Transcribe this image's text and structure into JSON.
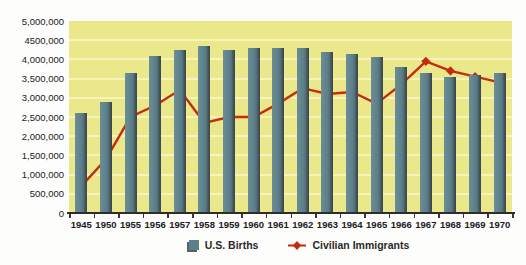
{
  "chart": {
    "y_axis_labels": [
      "5,000,000",
      "4500,000",
      "4,000,000",
      "3,500,000",
      "3,000,000",
      "2,500,000",
      "2,000,000",
      "1,500,000",
      "1,000,000",
      "500,000",
      "0"
    ],
    "background_color": "#ebe88c",
    "gridline_color": "#f7f4ba",
    "axis_color": "#2e2d2b"
  },
  "chart_data": {
    "type": "bar",
    "title": "",
    "xlabel": "",
    "ylabel": "",
    "categories": [
      "1945",
      "1950",
      "1955",
      "1956",
      "1957",
      "1958",
      "1959",
      "1960",
      "1961",
      "1962",
      "1963",
      "1964",
      "1965",
      "1966",
      "1967",
      "1968",
      "1969",
      "1970"
    ],
    "series": [
      {
        "name": "U.S. Births",
        "type": "bar",
        "color": "#5c7f8a",
        "values": [
          2600000,
          2900000,
          3650000,
          4100000,
          4250000,
          4350000,
          4250000,
          4300000,
          4300000,
          4300000,
          4200000,
          4150000,
          4050000,
          3800000,
          3650000,
          3550000,
          3600000,
          3650000
        ]
      },
      {
        "name": "Civilian Immigrants",
        "type": "line",
        "color": "#c22d12",
        "marker": "diamond",
        "values": [
          700000,
          1400000,
          2500000,
          2800000,
          3200000,
          2350000,
          2500000,
          2500000,
          2850000,
          3250000,
          3100000,
          3150000,
          2850000,
          3350000,
          3950000,
          3700000,
          3550000,
          3400000
        ]
      }
    ],
    "ylim": [
      0,
      5000000
    ],
    "ytick_interval": 500000,
    "grid": true,
    "legend_position": "bottom"
  }
}
